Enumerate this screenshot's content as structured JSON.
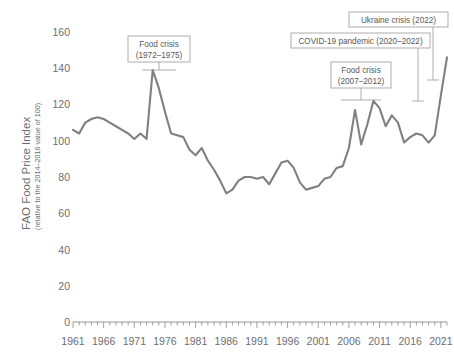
{
  "chart_data": {
    "type": "line",
    "title": "",
    "xlabel": "",
    "ylabel": "FAO Food Price Index",
    "ylabel_sub": "(relative to the 2014–2016 value of 100)",
    "ylim": [
      0,
      170
    ],
    "xlim": [
      1961,
      2022
    ],
    "grid": false,
    "legend": "none",
    "ytick_labels": [
      "0",
      "20",
      "40",
      "60",
      "80",
      "100",
      "120",
      "140",
      "160"
    ],
    "ytick_values": [
      0,
      20,
      40,
      60,
      80,
      100,
      120,
      140,
      160
    ],
    "xtick_labels": [
      "1961",
      "1966",
      "1971",
      "1976",
      "1981",
      "1986",
      "1991",
      "1996",
      "2001",
      "2006",
      "2011",
      "2016",
      "2021"
    ],
    "xtick_values": [
      1961,
      1966,
      1971,
      1976,
      1981,
      1986,
      1991,
      1996,
      2001,
      2006,
      2011,
      2016,
      2021
    ],
    "minor_tick_interval": 1,
    "line_color": "#808080",
    "series": [
      {
        "name": "FAO Food Price Index",
        "x": [
          1961,
          1962,
          1963,
          1964,
          1965,
          1966,
          1967,
          1968,
          1969,
          1970,
          1971,
          1972,
          1973,
          1974,
          1975,
          1976,
          1977,
          1978,
          1979,
          1980,
          1981,
          1982,
          1983,
          1984,
          1985,
          1986,
          1987,
          1988,
          1989,
          1990,
          1991,
          1992,
          1993,
          1994,
          1995,
          1996,
          1997,
          1998,
          1999,
          2000,
          2001,
          2002,
          2003,
          2004,
          2005,
          2006,
          2007,
          2008,
          2009,
          2010,
          2011,
          2012,
          2013,
          2014,
          2015,
          2016,
          2017,
          2018,
          2019,
          2020,
          2021,
          2022
        ],
        "values": [
          106,
          104,
          110,
          112,
          113,
          112,
          110,
          108,
          106,
          104,
          101,
          104,
          101,
          139,
          129,
          116,
          104,
          103,
          102,
          95,
          92,
          96,
          89,
          84,
          78,
          71,
          73,
          78,
          80,
          80,
          79,
          80,
          76,
          82,
          88,
          89,
          85,
          77,
          73,
          74,
          75,
          79,
          80,
          85,
          86,
          96,
          117,
          98,
          109,
          122,
          118,
          108,
          114,
          110,
          99,
          102,
          104,
          103,
          99,
          103,
          125,
          146
        ]
      }
    ],
    "annotations": [
      {
        "id": "food-crisis-1972",
        "lines": [
          "Food crisis",
          "(1972–1975)"
        ],
        "period_start": 1972,
        "period_end": 1975
      },
      {
        "id": "food-crisis-2007",
        "lines": [
          "Food crisis",
          "(2007–2012)"
        ],
        "period_start": 2007,
        "period_end": 2012
      },
      {
        "id": "covid-19-pandemic",
        "lines": [
          "COVID-19 pandemic (2020–2022)"
        ],
        "period_start": 2020,
        "period_end": 2022
      },
      {
        "id": "ukraine-crisis",
        "lines": [
          "Ukraine crisis (2022)"
        ],
        "period_start": 2022,
        "period_end": 2022
      }
    ]
  },
  "axis": {
    "y_title": "FAO Food Price Index",
    "y_subtitle": "(relative to the 2014–2016 value of 100)",
    "y_ticks": [
      "160",
      "140",
      "120",
      "100",
      "80",
      "60",
      "40",
      "20",
      "0"
    ],
    "x_ticks": [
      "1961",
      "1966",
      "1971",
      "1976",
      "1981",
      "1986",
      "1991",
      "1996",
      "2001",
      "2006",
      "2011",
      "2016",
      "2021"
    ]
  },
  "annotations": {
    "a1_l1": "Food crisis",
    "a1_l2": "(1972–1975)",
    "a2_l1": "Food crisis",
    "a2_l2": "(2007–2012)",
    "a3_l1": "COVID-19 pandemic (2020–2022)",
    "a4_l1": "Ukraine crisis (2022)"
  }
}
